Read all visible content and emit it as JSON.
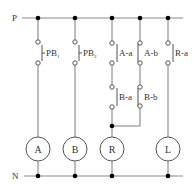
{
  "diagram": {
    "type": "relay ladder circuit",
    "buses": {
      "top_label": "P",
      "bottom_label": "N"
    },
    "branches": [
      {
        "id": "b1",
        "contacts": [
          {
            "label": "PB",
            "subscript": "1",
            "type": "normally-open"
          }
        ],
        "load": "A"
      },
      {
        "id": "b2",
        "contacts": [
          {
            "label": "PB",
            "subscript": "2",
            "type": "normally-open"
          }
        ],
        "load": "B"
      },
      {
        "id": "b3",
        "contacts": [
          {
            "label": "A-a",
            "type": "normally-open"
          },
          {
            "label": "B-a",
            "type": "normally-open"
          }
        ],
        "load": "R"
      },
      {
        "id": "b4",
        "contacts": [
          {
            "label": "A-b",
            "type": "normally-closed"
          },
          {
            "label": "B-b",
            "type": "normally-closed"
          }
        ],
        "load": null,
        "joins": "b3"
      },
      {
        "id": "b5",
        "contacts": [
          {
            "label": "R-a",
            "type": "normally-open"
          }
        ],
        "load": "L"
      }
    ],
    "labels": {
      "P": "P",
      "N": "N",
      "PB1": "PB",
      "PB1_sub": "1",
      "PB2": "PB",
      "PB2_sub": "2",
      "Aa": "A-a",
      "Ab": "A-b",
      "Ba": "B-a",
      "Bb": "B-b",
      "Ra": "R-a",
      "loadA": "A",
      "loadB": "B",
      "loadR": "R",
      "loadL": "L"
    }
  }
}
